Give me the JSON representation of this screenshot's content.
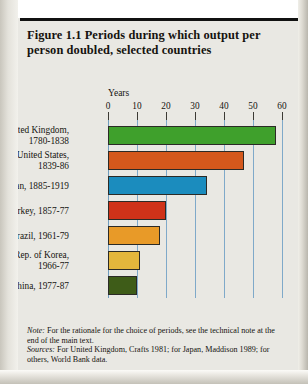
{
  "figure": {
    "title": "Figure 1.1  Periods during which output per person doubled, selected countries",
    "axis_title": "Years"
  },
  "footnote": {
    "note_label": "Note:",
    "note_text": " For the rationale for the choice of periods, see the technical note at the end of the main text.",
    "sources_label": "Sources:",
    "sources_text": " For United Kingdom, Crafts 1981; for Japan, Maddison 1989; for others, World Bank data."
  },
  "chart_data": {
    "type": "bar",
    "orientation": "horizontal",
    "title": "Figure 1.1  Periods during which output per person doubled, selected countries",
    "xlabel": "Years",
    "ylabel": "",
    "xlim": [
      0,
      60
    ],
    "xticks": [
      0,
      10,
      20,
      30,
      40,
      50,
      60
    ],
    "xtick_labels": [
      "0",
      "10",
      "20",
      "30",
      "40",
      "50",
      "60"
    ],
    "grid": true,
    "legend": "none",
    "categories": [
      "United Kingdom,\n1780-1838",
      "United States,\n1839-86",
      "Japan, 1885-1919",
      "Turkey, 1857-77",
      "Brazil, 1961-79",
      "Rep. of Korea,\n1966-77",
      "China, 1977-87"
    ],
    "values": [
      58,
      47,
      34,
      20,
      18,
      11,
      10
    ],
    "colors": [
      "#3fa02c",
      "#d4581c",
      "#1b8cbe",
      "#cf3219",
      "#e89a28",
      "#e3b63c",
      "#3e5c18"
    ]
  }
}
